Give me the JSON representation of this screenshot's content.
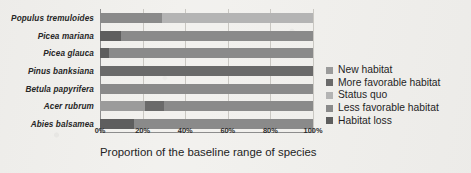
{
  "chart_data": {
    "type": "bar",
    "orientation": "horizontal",
    "stacked": true,
    "normalized_percent": true,
    "title": "",
    "xlabel": "Proportion of the baseline range of species",
    "ylabel": "",
    "xlim": [
      0,
      100
    ],
    "xticks": [
      0,
      20,
      40,
      60,
      80,
      100
    ],
    "xtick_labels": [
      "0%",
      "20%",
      "40%",
      "60%",
      "80%",
      "100%"
    ],
    "grid": true,
    "grid_axis": "x",
    "legend_position": "right",
    "categories": [
      "Populus tremuloides",
      "Picea mariana",
      "Picea glauca",
      "Pinus banksiana",
      "Betula papyrifera",
      "Acer rubrum",
      "Abies balsamea"
    ],
    "series": [
      {
        "name": "New habitat",
        "color": "#9b9b9b",
        "values": [
          0,
          0,
          0,
          0,
          0,
          21,
          0
        ]
      },
      {
        "name": "More favorable habitat",
        "color": "#6a6a6a",
        "values": [
          0,
          0,
          0,
          100,
          0,
          9,
          0
        ]
      },
      {
        "name": "Status quo",
        "color": "#b4b4b4",
        "values": [
          71,
          0,
          0,
          0,
          0,
          0,
          0
        ]
      },
      {
        "name": "Less favorable habitat",
        "color": "#8a8a8a",
        "values": [
          29,
          90,
          96,
          0,
          100,
          70,
          84
        ]
      },
      {
        "name": "Habitat loss",
        "color": "#5e5e5e",
        "values": [
          0,
          10,
          4,
          0,
          0,
          0,
          16
        ]
      }
    ],
    "bars": [
      {
        "category": "Populus tremuloides",
        "segments": [
          {
            "series": "Less favorable habitat",
            "start": 0,
            "end": 29,
            "value": 29,
            "color": "#8a8a8a"
          },
          {
            "series": "Status quo",
            "start": 29,
            "end": 100,
            "value": 71,
            "color": "#b4b4b4"
          }
        ]
      },
      {
        "category": "Picea mariana",
        "segments": [
          {
            "series": "Habitat loss",
            "start": 0,
            "end": 10,
            "value": 10,
            "color": "#5e5e5e"
          },
          {
            "series": "Less favorable habitat",
            "start": 10,
            "end": 100,
            "value": 90,
            "color": "#8a8a8a"
          }
        ]
      },
      {
        "category": "Picea glauca",
        "segments": [
          {
            "series": "Habitat loss",
            "start": 0,
            "end": 4,
            "value": 4,
            "color": "#5e5e5e"
          },
          {
            "series": "Less favorable habitat",
            "start": 4,
            "end": 100,
            "value": 96,
            "color": "#8a8a8a"
          }
        ]
      },
      {
        "category": "Pinus banksiana",
        "segments": [
          {
            "series": "More favorable habitat",
            "start": 0,
            "end": 100,
            "value": 100,
            "color": "#6a6a6a"
          }
        ]
      },
      {
        "category": "Betula papyrifera",
        "segments": [
          {
            "series": "Less favorable habitat",
            "start": 0,
            "end": 100,
            "value": 100,
            "color": "#8a8a8a"
          }
        ]
      },
      {
        "category": "Acer rubrum",
        "segments": [
          {
            "series": "New habitat",
            "start": 0,
            "end": 21,
            "value": 21,
            "color": "#9b9b9b"
          },
          {
            "series": "More favorable habitat",
            "start": 21,
            "end": 30,
            "value": 9,
            "color": "#6a6a6a"
          },
          {
            "series": "Less favorable habitat",
            "start": 30,
            "end": 100,
            "value": 70,
            "color": "#8a8a8a"
          }
        ]
      },
      {
        "category": "Abies balsamea",
        "segments": [
          {
            "series": "Habitat loss",
            "start": 0,
            "end": 16,
            "value": 16,
            "color": "#5e5e5e"
          },
          {
            "series": "Less favorable habitat",
            "start": 16,
            "end": 100,
            "value": 84,
            "color": "#8a8a8a"
          }
        ]
      }
    ],
    "legend": [
      {
        "label": "New habitat",
        "color": "#9b9b9b"
      },
      {
        "label": "More favorable habitat",
        "color": "#6a6a6a"
      },
      {
        "label": "Status quo",
        "color": "#b4b4b4"
      },
      {
        "label": "Less favorable habitat",
        "color": "#8a8a8a"
      },
      {
        "label": "Habitat loss",
        "color": "#5e5e5e"
      }
    ]
  }
}
